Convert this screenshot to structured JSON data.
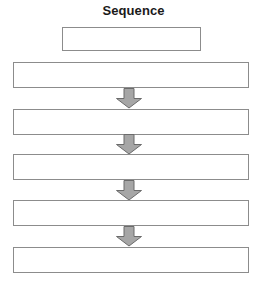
{
  "diagram": {
    "title": "Sequence",
    "type": "flowchart",
    "orientation": "vertical",
    "canvas": {
      "width": 261,
      "height": 286
    },
    "colors": {
      "background": "#ffffff",
      "box_border": "#8c8c8c",
      "box_fill": "#ffffff",
      "arrow_fill": "#a6a6a6",
      "arrow_stroke": "#6b6b6b",
      "title_text": "#1a1a1a"
    },
    "nodes": [
      {
        "id": "node-1",
        "label": "",
        "x": 62,
        "y": 27,
        "w": 139,
        "h": 24
      },
      {
        "id": "node-2",
        "label": "",
        "x": 13,
        "y": 62,
        "w": 236,
        "h": 26
      },
      {
        "id": "node-3",
        "label": "",
        "x": 13,
        "y": 109,
        "w": 236,
        "h": 26
      },
      {
        "id": "node-4",
        "label": "",
        "x": 13,
        "y": 154,
        "w": 236,
        "h": 26
      },
      {
        "id": "node-5",
        "label": "",
        "x": 13,
        "y": 200,
        "w": 236,
        "h": 26
      },
      {
        "id": "node-6",
        "label": "",
        "x": 13,
        "y": 247,
        "w": 236,
        "h": 26
      }
    ],
    "arrows": [
      {
        "id": "arrow-1",
        "from": "node-2",
        "to": "node-3",
        "direction": "down",
        "x": 115,
        "y": 88,
        "w": 28,
        "h": 21
      },
      {
        "id": "arrow-2",
        "from": "node-3",
        "to": "node-4",
        "direction": "down",
        "x": 115,
        "y": 134,
        "w": 28,
        "h": 21
      },
      {
        "id": "arrow-3",
        "from": "node-4",
        "to": "node-5",
        "direction": "down",
        "x": 115,
        "y": 180,
        "w": 28,
        "h": 21
      },
      {
        "id": "arrow-4",
        "from": "node-5",
        "to": "node-6",
        "direction": "down",
        "x": 115,
        "y": 226,
        "w": 28,
        "h": 21
      }
    ]
  }
}
